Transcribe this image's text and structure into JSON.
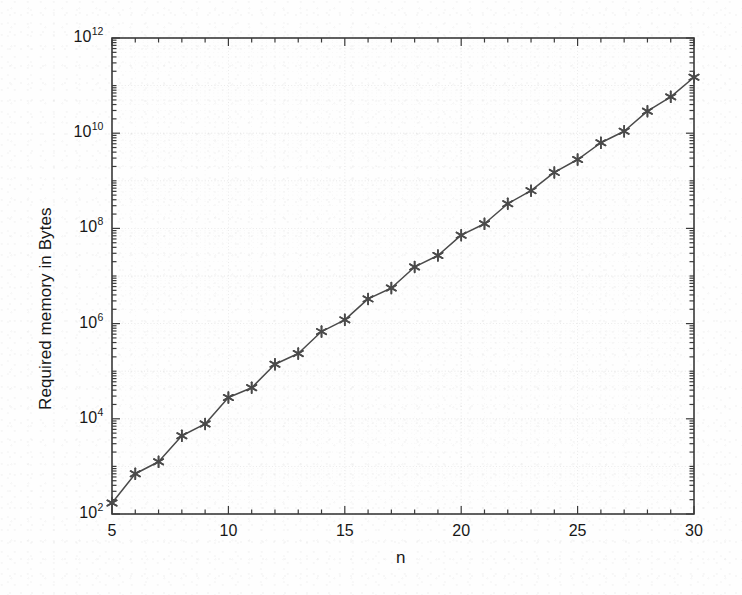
{
  "figure": {
    "background_color": "#fefefe",
    "axis_color": "#3a3a3a",
    "series_color": "#4a4a4a"
  },
  "chart_data": {
    "type": "line",
    "title": "",
    "subtitle": "",
    "xlabel": "n",
    "ylabel": "Required memory in Bytes",
    "yscale": "log",
    "xscale": "linear",
    "xlim": [
      5,
      30
    ],
    "ylim": [
      100,
      1000000000000
    ],
    "grid": true,
    "legend": null,
    "marker": "asterisk",
    "line_style": "solid",
    "x_tick_labels": [
      "5",
      "10",
      "15",
      "20",
      "25",
      "30"
    ],
    "x_tick_values": [
      5,
      10,
      15,
      20,
      25,
      30
    ],
    "y_tick_labels": [
      "10^2",
      "10^4",
      "10^6",
      "10^8",
      "10^10",
      "10^12"
    ],
    "y_tick_mantissas": [
      "10",
      "10",
      "10",
      "10",
      "10",
      "10"
    ],
    "y_tick_exponents": [
      "2",
      "4",
      "6",
      "8",
      "10",
      "12"
    ],
    "y_tick_values": [
      100,
      10000,
      1000000,
      100000000,
      10000000000,
      1000000000000
    ],
    "x": [
      5,
      6,
      7,
      8,
      9,
      10,
      11,
      12,
      13,
      14,
      15,
      16,
      17,
      18,
      19,
      20,
      21,
      22,
      23,
      24,
      25,
      26,
      27,
      28,
      29,
      30
    ],
    "y": [
      170,
      700,
      1250,
      4400,
      7800,
      28000,
      45000,
      140000,
      235000,
      680000,
      1200000,
      3300000,
      5600000,
      15500000,
      27000000,
      72000000,
      125000000,
      330000000,
      620000000,
      1500000000,
      2800000000,
      6300000000,
      11000000000,
      29000000000,
      58000000000,
      150000000000
    ],
    "series": [
      {
        "name": "Required memory",
        "values": [
          170,
          700,
          1250,
          4400,
          7800,
          28000,
          45000,
          140000,
          235000,
          680000,
          1200000,
          3300000,
          5600000,
          15500000,
          27000000,
          72000000,
          125000000,
          330000000,
          620000000,
          1500000000,
          2800000000,
          6300000000,
          11000000000,
          29000000000,
          58000000000,
          150000000000
        ]
      }
    ]
  }
}
